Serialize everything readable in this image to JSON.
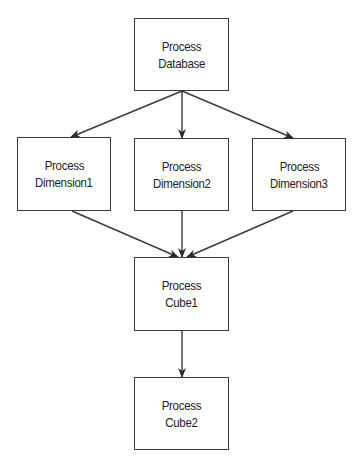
{
  "diagram": {
    "type": "flowchart",
    "direction": "top-to-bottom",
    "colors": {
      "background": "#ffffff",
      "stroke": "#3a3a3a",
      "text": "#222222"
    },
    "nodes": [
      {
        "id": "db",
        "line1": "Process",
        "line2": "Database",
        "x": 134,
        "y": 18,
        "w": 95,
        "h": 73
      },
      {
        "id": "dim1",
        "line1": "Process",
        "line2": "Dimension1",
        "x": 17,
        "y": 137,
        "w": 94,
        "h": 74
      },
      {
        "id": "dim2",
        "line1": "Process",
        "line2": "Dimension2",
        "x": 134,
        "y": 138,
        "w": 95,
        "h": 73
      },
      {
        "id": "dim3",
        "line1": "Process",
        "line2": "Dimension3",
        "x": 252,
        "y": 138,
        "w": 94,
        "h": 73
      },
      {
        "id": "cube1",
        "line1": "Process",
        "line2": "Cube1",
        "x": 134,
        "y": 257,
        "w": 95,
        "h": 74
      },
      {
        "id": "cube2",
        "line1": "Process",
        "line2": "Cube2",
        "x": 134,
        "y": 377,
        "w": 95,
        "h": 73
      }
    ],
    "edges": [
      {
        "from": "db",
        "to": "dim1",
        "x1": 182,
        "y1": 91,
        "x2": 71,
        "y2": 137
      },
      {
        "from": "db",
        "to": "dim2",
        "x1": 182,
        "y1": 91,
        "x2": 182,
        "y2": 138
      },
      {
        "from": "db",
        "to": "dim3",
        "x1": 182,
        "y1": 91,
        "x2": 293,
        "y2": 138
      },
      {
        "from": "dim1",
        "to": "cube1",
        "x1": 72,
        "y1": 211,
        "x2": 178,
        "y2": 257
      },
      {
        "from": "dim2",
        "to": "cube1",
        "x1": 182,
        "y1": 211,
        "x2": 182,
        "y2": 257
      },
      {
        "from": "dim3",
        "to": "cube1",
        "x1": 293,
        "y1": 211,
        "x2": 187,
        "y2": 257
      },
      {
        "from": "cube1",
        "to": "cube2",
        "x1": 182,
        "y1": 331,
        "x2": 182,
        "y2": 377
      }
    ]
  }
}
